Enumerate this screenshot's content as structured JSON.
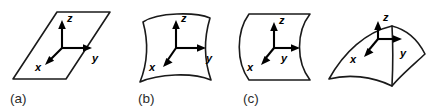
{
  "figure": {
    "title": "",
    "background_color": "#ffffff",
    "stroke_color": "#1a1a1a",
    "label_color": "#2b2b2b",
    "panels": [
      {
        "id": "panel-a",
        "label": "(a)",
        "label_x": 10,
        "label_y": 103,
        "surface_kind": "flat-plane",
        "surface_description": "flat parallelogram plane",
        "outline": "M 13 79 L 57 12 L 110 12 L 66 79 Z",
        "origin_x": 62,
        "origin_y": 48,
        "axes": [
          {
            "name": "z",
            "label": "z",
            "dx": 0,
            "dy": -26,
            "label_x": 67,
            "label_y": 22
          },
          {
            "name": "y",
            "label": "y",
            "dx": 29,
            "dy": 0,
            "label_x": 92,
            "label_y": 62
          },
          {
            "name": "x",
            "label": "x",
            "dx": -17,
            "dy": 17,
            "label_x": 35,
            "label_y": 71
          }
        ]
      },
      {
        "id": "panel-b",
        "label": "(b)",
        "label_x": 138,
        "label_y": 103,
        "surface_kind": "saddle",
        "surface_description": "saddle shaped surface patch",
        "outline": "M 143 22 C 158 12 196 12 210 18 C 204 38 204 60 211 80 C 192 72 158 74 140 82 C 148 62 148 40 143 22 Z",
        "origin_x": 176,
        "origin_y": 48,
        "axes": [
          {
            "name": "z",
            "label": "z",
            "dx": 0,
            "dy": -26,
            "label_x": 181,
            "label_y": 22
          },
          {
            "name": "y",
            "label": "y",
            "dx": 29,
            "dy": 0,
            "label_x": 206,
            "label_y": 62
          },
          {
            "name": "x",
            "label": "x",
            "dx": -17,
            "dy": 17,
            "label_x": 149,
            "label_y": 71
          }
        ]
      },
      {
        "id": "panel-c",
        "label": "(c)",
        "label_x": 243,
        "label_y": 103,
        "surface_kind": "cylinder",
        "surface_description": "cylindrical curved surface",
        "outline": "M 249 14 L 310 14 C 296 32 296 62 310 80 L 249 80 C 236 62 236 32 249 14 Z",
        "origin_x": 274,
        "origin_y": 48,
        "axes": [
          {
            "name": "z",
            "label": "z",
            "dx": 0,
            "dy": -26,
            "label_x": 279,
            "label_y": 22
          },
          {
            "name": "y",
            "label": "y",
            "dx": 29,
            "dy": 0,
            "label_x": 300,
            "label_y": 62
          },
          {
            "name": "x",
            "label": "x",
            "dx": -17,
            "dy": 17,
            "label_x": 247,
            "label_y": 71
          }
        ]
      },
      {
        "id": "panel-d",
        "label": "",
        "label_x": 0,
        "label_y": 0,
        "surface_kind": "dome",
        "surface_description": "tilted convex dome surface patch",
        "outline": "M 329 79 C 344 52 366 32 392 26 C 408 30 419 42 425 54 C 412 66 400 76 392 86 C 372 76 348 74 329 79 Z",
        "origin_x": 378,
        "origin_y": 39,
        "axes": [
          {
            "name": "z",
            "label": "z",
            "dx": 0,
            "dy": -18,
            "label_x": 383,
            "label_y": 21
          },
          {
            "name": "y",
            "label": "y",
            "dx": 29,
            "dy": 0,
            "label_x": 400,
            "label_y": 57
          },
          {
            "name": "x",
            "label": "x",
            "dx": -17,
            "dy": 17,
            "label_x": 350,
            "label_y": 63
          }
        ]
      }
    ]
  }
}
